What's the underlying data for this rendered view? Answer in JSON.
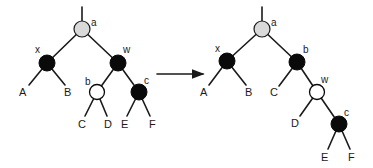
{
  "diagram": {
    "type": "red-black-tree-rotation",
    "arrow_color": "#1a1a1a",
    "colors": {
      "black": "#0a0a0a",
      "white": "#ffffff",
      "gray": "#d9d9d9"
    },
    "left_tree": {
      "nodes": {
        "a": {
          "label": "a",
          "color": "gray"
        },
        "x": {
          "label": "x",
          "color": "black"
        },
        "w": {
          "label": "w",
          "color": "black"
        },
        "b": {
          "label": "b",
          "color": "white"
        },
        "c": {
          "label": "c",
          "color": "black"
        }
      },
      "leaves": {
        "A": "A",
        "B": "B",
        "C": "C",
        "D": "D",
        "E": "E",
        "F": "F"
      }
    },
    "right_tree": {
      "nodes": {
        "a": {
          "label": "a",
          "color": "gray"
        },
        "x": {
          "label": "x",
          "color": "black"
        },
        "b": {
          "label": "b",
          "color": "black"
        },
        "w": {
          "label": "w",
          "color": "white"
        },
        "c": {
          "label": "c",
          "color": "black"
        }
      },
      "leaves": {
        "A": "A",
        "B": "B",
        "C": "C",
        "D": "D",
        "E": "E",
        "F": "F"
      }
    }
  }
}
